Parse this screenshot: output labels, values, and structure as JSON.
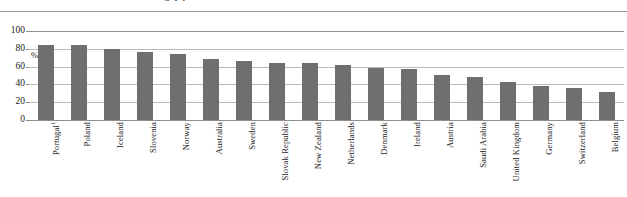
{
  "figure": {
    "title_remnant": "fy y p",
    "axis_unit_label": "%"
  },
  "chart_data": {
    "type": "bar",
    "title": "",
    "xlabel": "",
    "ylabel": "%",
    "ylim": [
      0,
      100
    ],
    "yticks": [
      "0",
      "20",
      "40",
      "60",
      "80",
      "100"
    ],
    "grid": true,
    "legend": "none",
    "bar_color": "#6f6f6f",
    "categories": [
      "Portugal¹",
      "Poland",
      "Iceland",
      "Slovenia",
      "Norway",
      "Australia",
      "Sweden",
      "Slovak Republic",
      "New Zealand",
      "Netherlands",
      "Denmark",
      "Ireland",
      "Austria",
      "Saudi Arabia",
      "United Kingdom",
      "Germany",
      "Switzerland",
      "Belgium"
    ],
    "values": [
      84,
      84,
      80,
      76,
      74,
      68,
      66,
      64,
      64,
      62,
      59,
      57,
      51,
      48,
      43,
      38,
      36,
      32
    ],
    "footnote_marker": "1"
  }
}
